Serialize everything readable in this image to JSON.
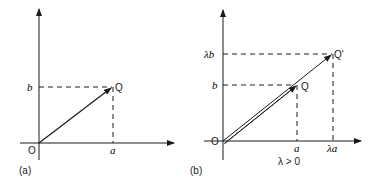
{
  "panel_a": {
    "caption": "(a)",
    "origin_label": "O",
    "point_label": "Q",
    "x_tick_label": "a",
    "y_tick_label": "b"
  },
  "panel_b": {
    "caption": "(b)",
    "origin_label": "O",
    "point_label": "Q",
    "scaled_point_label": "Q'",
    "x_tick_label": "a",
    "x_scaled_tick_label": "λa",
    "y_tick_label": "b",
    "y_scaled_tick_label": "λb",
    "condition": "λ > 0"
  },
  "colors": {
    "ink": "#1a1a1a",
    "background": "#ffffff"
  }
}
